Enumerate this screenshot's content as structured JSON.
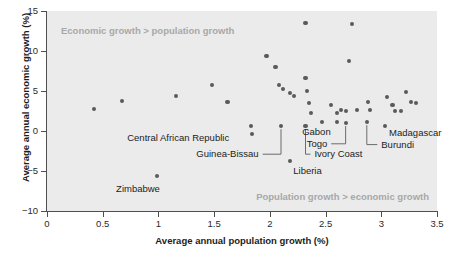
{
  "chart_data": {
    "type": "scatter",
    "title": "",
    "xlabel": "Average annual population growth (%)",
    "ylabel": "Average annual economic growth (%)",
    "xlim": [
      0,
      3.5
    ],
    "ylim": [
      -10,
      15
    ],
    "xticks": [
      0,
      0.5,
      1,
      1.5,
      2,
      2.5,
      3,
      3.5
    ],
    "xticklabels": [
      "0",
      "0.5",
      "1",
      "1.5",
      "2",
      "2.5",
      "3",
      "3.5"
    ],
    "yticks": [
      -10,
      -5,
      0,
      5,
      10,
      15
    ],
    "yticklabels": [
      "-10",
      "-5",
      "0",
      "5",
      "10",
      "15"
    ],
    "grid": false,
    "legend": null,
    "plot_background": "#ebebeb",
    "marker_color": "#5a5a5a",
    "annotations": [
      {
        "name": "quadrant-note-top-left",
        "text": "Economic growth > population growth"
      },
      {
        "name": "quadrant-note-bottom-right",
        "text": "Population growth > economic growth"
      }
    ],
    "points": [
      {
        "x": 0.42,
        "y": 2.8
      },
      {
        "x": 0.67,
        "y": 3.7
      },
      {
        "x": 1.16,
        "y": 4.4
      },
      {
        "x": 1.48,
        "y": 5.7
      },
      {
        "x": 1.62,
        "y": 3.6
      },
      {
        "x": 1.83,
        "y": 0.6
      },
      {
        "x": 1.97,
        "y": 9.4
      },
      {
        "x": 2.05,
        "y": 8.0
      },
      {
        "x": 2.08,
        "y": 5.7
      },
      {
        "x": 2.12,
        "y": 5.2
      },
      {
        "x": 2.18,
        "y": 4.8
      },
      {
        "x": 2.22,
        "y": 4.4
      },
      {
        "x": 2.32,
        "y": 13.5
      },
      {
        "x": 2.32,
        "y": 6.6
      },
      {
        "x": 2.33,
        "y": 5.0
      },
      {
        "x": 2.35,
        "y": 3.5
      },
      {
        "x": 2.37,
        "y": 2.3
      },
      {
        "x": 2.47,
        "y": 1.1
      },
      {
        "x": 2.55,
        "y": 3.3
      },
      {
        "x": 2.6,
        "y": 2.3
      },
      {
        "x": 2.64,
        "y": 2.6
      },
      {
        "x": 2.68,
        "y": 2.5
      },
      {
        "x": 2.74,
        "y": 13.4
      },
      {
        "x": 2.71,
        "y": 8.7
      },
      {
        "x": 2.78,
        "y": 2.6
      },
      {
        "x": 2.88,
        "y": 3.6
      },
      {
        "x": 2.9,
        "y": 2.6
      },
      {
        "x": 3.05,
        "y": 4.2
      },
      {
        "x": 3.1,
        "y": 3.3
      },
      {
        "x": 3.12,
        "y": 2.5
      },
      {
        "x": 3.18,
        "y": 2.5
      },
      {
        "x": 3.22,
        "y": 4.9
      },
      {
        "x": 3.27,
        "y": 3.6
      },
      {
        "x": 3.31,
        "y": 3.5
      }
    ],
    "labeled_points": [
      {
        "label": "Zimbabwe",
        "x": 0.99,
        "y": -5.6,
        "label_x": 0.62,
        "label_y": -7.2,
        "leader": false
      },
      {
        "label": "Central African Republic",
        "x": 1.84,
        "y": -0.4,
        "label_x": 0.72,
        "label_y": -0.9,
        "leader": false
      },
      {
        "label": "Guinea-Bissau",
        "x": 2.1,
        "y": 0.6,
        "label_x": 1.34,
        "label_y": -2.9,
        "leader": true
      },
      {
        "label": "Liberia",
        "x": 2.18,
        "y": -3.8,
        "label_x": 2.21,
        "label_y": -5.0,
        "leader": false
      },
      {
        "label": "Ivory Coast",
        "x": 2.32,
        "y": 0.6,
        "label_x": 2.4,
        "label_y": -2.9,
        "leader": true
      },
      {
        "label": "Togo",
        "x": 2.68,
        "y": 1.0,
        "label_x": 2.33,
        "label_y": -1.6,
        "leader": true
      },
      {
        "label": "Gabon",
        "x": 2.6,
        "y": 1.1,
        "label_x": 2.29,
        "label_y": -0.1,
        "leader": false
      },
      {
        "label": "Burundi",
        "x": 2.87,
        "y": 1.1,
        "label_x": 3.0,
        "label_y": -1.7,
        "leader": true
      },
      {
        "label": "Madagascar",
        "x": 3.03,
        "y": 0.6,
        "label_x": 3.07,
        "label_y": -0.3,
        "leader": false
      }
    ]
  }
}
